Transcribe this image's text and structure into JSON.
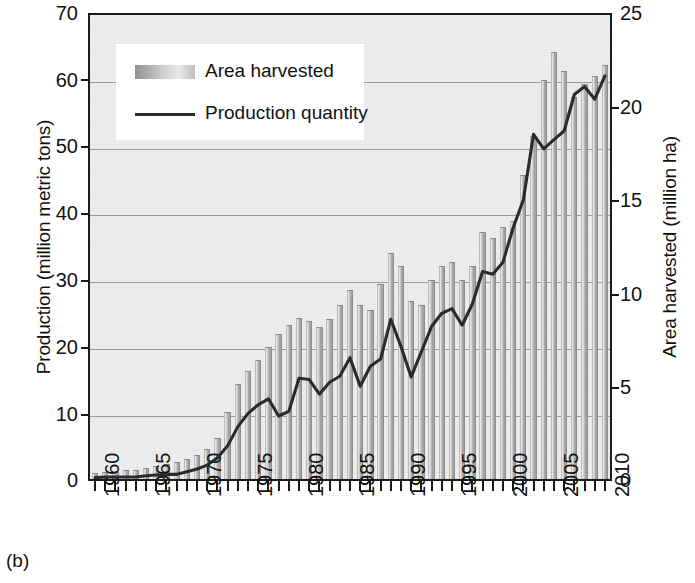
{
  "caption": "(b)",
  "legend": {
    "area_label": "Area harvested",
    "line_label": "Production quantity"
  },
  "axes": {
    "left_title": "Production (million metric tons)",
    "right_title": "Area harvested (million ha)",
    "left_ticks": [
      "0",
      "10",
      "20",
      "30",
      "40",
      "50",
      "60",
      "70"
    ],
    "right_ticks": [
      "0",
      "5",
      "10",
      "15",
      "20",
      "25"
    ],
    "x_ticks": [
      "1960",
      "1965",
      "1970",
      "1975",
      "1980",
      "1985",
      "1990",
      "1995",
      "2000",
      "2005",
      "2010"
    ]
  },
  "colors": {
    "plot_background": "#ececec",
    "axis": "#1a1a1a",
    "gridline": "#9a9a9a",
    "bar_light": "#e8e8e8",
    "bar_dark": "#9a9a9a",
    "line": "#2b2b2b",
    "text": "#111111"
  },
  "chart_data": {
    "type": "bar",
    "title": "",
    "subtitle": "",
    "xlabel": "",
    "ylabel": "Production (million metric tons)",
    "y2label": "Area harvested (million ha)",
    "ylim": [
      0,
      70
    ],
    "y2lim": [
      0,
      25
    ],
    "xlim": [
      1960,
      2010
    ],
    "grid": true,
    "legend_position": "top-left",
    "x": [
      1960,
      1961,
      1962,
      1963,
      1964,
      1965,
      1966,
      1967,
      1968,
      1969,
      1970,
      1971,
      1972,
      1973,
      1974,
      1975,
      1976,
      1977,
      1978,
      1979,
      1980,
      1981,
      1982,
      1983,
      1984,
      1985,
      1986,
      1987,
      1988,
      1989,
      1990,
      1991,
      1992,
      1993,
      1994,
      1995,
      1996,
      1997,
      1998,
      1999,
      2000,
      2001,
      2002,
      2003,
      2004,
      2005,
      2006,
      2007,
      2008,
      2009,
      2010
    ],
    "series": [
      {
        "name": "Area harvested",
        "unit": "million ha",
        "axis": "right",
        "type": "bar",
        "values": [
          0.3,
          0.4,
          0.4,
          0.5,
          0.5,
          0.6,
          0.7,
          0.8,
          0.9,
          1.1,
          1.3,
          1.6,
          2.2,
          3.6,
          5.1,
          5.8,
          6.4,
          7.1,
          7.8,
          8.3,
          8.7,
          8.5,
          8.2,
          8.6,
          9.4,
          10.2,
          9.4,
          9.1,
          10.5,
          12.2,
          11.5,
          9.6,
          9.4,
          10.7,
          11.5,
          11.7,
          10.7,
          11.5,
          13.3,
          13.0,
          13.6,
          13.9,
          16.4,
          18.5,
          21.5,
          23.0,
          22.0,
          20.6,
          21.3,
          21.7,
          22.3
        ]
      },
      {
        "name": "Production quantity",
        "unit": "million metric tons",
        "axis": "left",
        "type": "line",
        "values": [
          0.2,
          0.3,
          0.3,
          0.3,
          0.3,
          0.5,
          0.6,
          0.7,
          0.7,
          1.1,
          1.5,
          2.1,
          3.2,
          5.0,
          7.9,
          9.9,
          11.2,
          12.1,
          9.5,
          10.2,
          15.2,
          15.0,
          12.8,
          14.6,
          15.5,
          18.3,
          14.0,
          17.0,
          18.1,
          24.1,
          20.0,
          15.4,
          19.2,
          23.0,
          25.0,
          25.7,
          23.2,
          26.4,
          31.3,
          30.9,
          32.7,
          37.9,
          42.1,
          52.0,
          49.8,
          51.2,
          52.5,
          58.0,
          59.2,
          57.3,
          60.8
        ]
      }
    ],
    "notes": [
      "Bars read against the right axis (area harvested, million ha).",
      "Line reads against the left axis (production quantity, million metric tons)."
    ]
  }
}
